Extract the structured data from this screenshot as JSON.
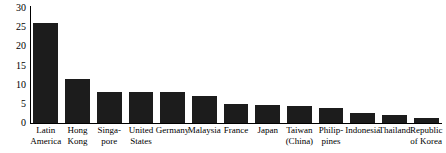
{
  "chart_data": {
    "type": "bar",
    "title": "",
    "subtitle": "",
    "xlabel": "",
    "ylabel": "",
    "ylim": [
      0,
      30
    ],
    "yticks": [
      0,
      5,
      10,
      15,
      20,
      25,
      30
    ],
    "grid": false,
    "legend": false,
    "bar_color": "#1c1c1c",
    "axis_color": "#000000",
    "categories": [
      "Latin America",
      "Hong Kong",
      "Singapore",
      "United States",
      "Germany",
      "Malaysia",
      "France",
      "Japan",
      "Taiwan (China)",
      "Philippines",
      "Indonesia",
      "Thailand",
      "Republic of Korea"
    ],
    "category_label_lines": [
      [
        "Latin",
        "America"
      ],
      [
        "Hong",
        "Kong"
      ],
      [
        "Singa-",
        "pore"
      ],
      [
        "United",
        "States"
      ],
      [
        "Germany"
      ],
      [
        "Malaysia"
      ],
      [
        "France"
      ],
      [
        "Japan"
      ],
      [
        "Taiwan",
        "(China)"
      ],
      [
        "Philip-",
        "pines"
      ],
      [
        "Indonesia"
      ],
      [
        "Thailand"
      ],
      [
        "Republic",
        "of Korea"
      ]
    ],
    "values": [
      26,
      11.5,
      8,
      8,
      8,
      7,
      5,
      4.8,
      4.5,
      3.8,
      2.5,
      2.2,
      1.2
    ]
  }
}
